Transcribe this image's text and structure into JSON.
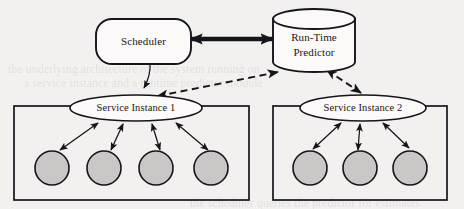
{
  "diagram": {
    "background_color": "#f2f1ef",
    "nodes": {
      "scheduler": {
        "label": "Scheduler",
        "shape": "rounded-rectangle",
        "fill": "#fbfaf8",
        "stroke": "#15151a"
      },
      "predictor": {
        "label_line1": "Run-Time",
        "label_line2": "Predictor",
        "shape": "cylinder",
        "fill": "#fbfaf8",
        "stroke": "#15151a"
      },
      "service_instance_1": {
        "label": "Service Instance 1",
        "shape": "ellipse",
        "fill": "#fbfaf8",
        "stroke": "#15151a"
      },
      "service_instance_2": {
        "label": "Service Instance 2",
        "shape": "ellipse",
        "fill": "#fbfaf8",
        "stroke": "#15151a"
      }
    },
    "containers": [
      {
        "name": "service-instance-1-container",
        "worker_count": 4
      },
      {
        "name": "service-instance-2-container",
        "worker_count": 3
      }
    ],
    "workers": {
      "shape": "circle",
      "fill": "#c9c8c6",
      "stroke": "#15151a"
    },
    "edges": [
      {
        "name": "scheduler-to-predictor",
        "style": "thick-solid",
        "arrows": "both"
      },
      {
        "name": "scheduler-to-service-instance-1",
        "style": "thin-solid",
        "arrows": "end"
      },
      {
        "name": "service-instance-1-to-predictor",
        "style": "dashed",
        "arrows": "both"
      },
      {
        "name": "predictor-to-service-instance-2",
        "style": "dashed",
        "arrows": "both"
      },
      {
        "name": "service-instance-1-to-workers",
        "style": "thin-solid",
        "arrows": "both"
      },
      {
        "name": "service-instance-2-to-workers",
        "style": "thin-solid",
        "arrows": "both"
      }
    ]
  },
  "artifacts": {
    "bleed_line_1": "the underlying architecture of the system running on",
    "bleed_line_2": "a service instance and a runtime predictor module",
    "bleed_line_3": "the scheduler queries the predictor for estimates"
  }
}
